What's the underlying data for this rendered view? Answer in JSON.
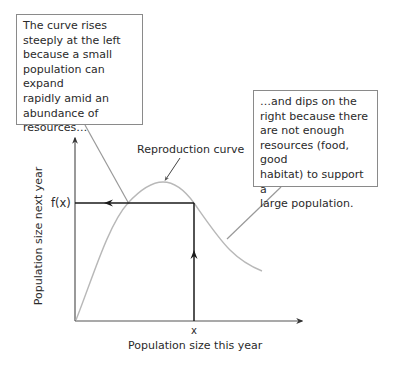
{
  "callouts": {
    "left": {
      "lines": [
        "The curve rises",
        "steeply at the left",
        "because a small",
        "population can expand",
        "rapidly amid an",
        "abundance of",
        "resources…"
      ]
    },
    "right": {
      "lines": [
        "…and dips on the",
        "right because there",
        "are not enough",
        "resources (food, good",
        "habitat) to support a",
        "large population."
      ]
    }
  },
  "labels": {
    "curve": "Reproduction curve",
    "fx": "f(x)",
    "x_tick": "x",
    "x_axis": "Population size this year",
    "y_axis": "Population size next year"
  },
  "colors": {
    "axis": "#555555",
    "curve": "#b8b8b8",
    "cobweb": "#1a1a1a",
    "callout_border": "#8a8a8a",
    "pointer": "#999999"
  }
}
